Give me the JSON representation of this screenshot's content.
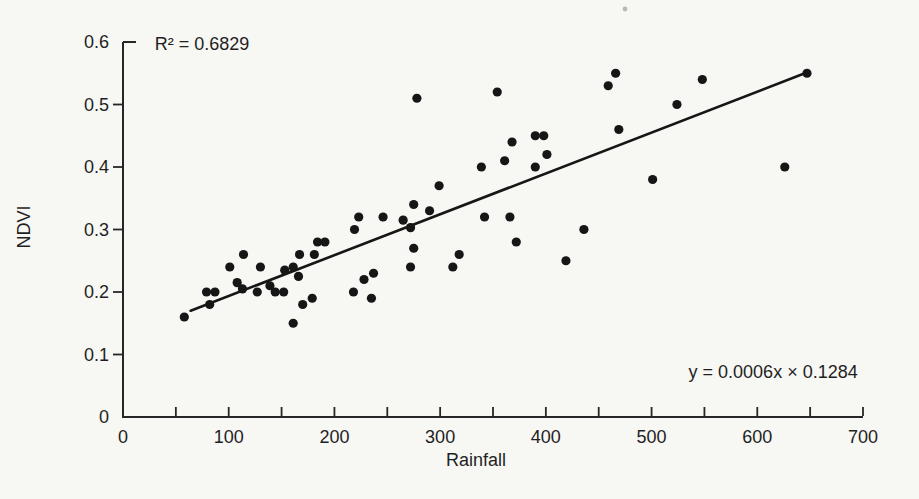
{
  "chart_data": {
    "type": "scatter",
    "title": "",
    "xlabel": "Rainfall",
    "ylabel": "NDVI",
    "xlim": [
      0,
      700
    ],
    "ylim": [
      0,
      0.6
    ],
    "grid": false,
    "legend": "none",
    "x_tick_labels": [
      "0",
      "100",
      "200",
      "300",
      "400",
      "500",
      "600",
      "700"
    ],
    "x_tick_values": [
      0,
      100,
      200,
      300,
      400,
      500,
      600,
      700
    ],
    "x_tick_step_minor": 50,
    "y_tick_labels": [
      "0",
      "0.1",
      "0.2",
      "0.3",
      "0.4",
      "0.5",
      "0.6"
    ],
    "y_tick_values": [
      0,
      0.1,
      0.2,
      0.3,
      0.4,
      0.5,
      0.6
    ],
    "annotations": [
      {
        "id": "r-squared",
        "text": "R² = 0.6829",
        "x": 30,
        "y": 0.588,
        "anchor": "start"
      },
      {
        "id": "equation",
        "text": "y = 0.0006x × 0.1284",
        "x": 695,
        "y": 0.062,
        "anchor": "end"
      }
    ],
    "trendline": {
      "x1": 64,
      "y1": 0.17,
      "x2": 648,
      "y2": 0.552
    },
    "points": [
      [
        58,
        0.16
      ],
      [
        79,
        0.2
      ],
      [
        82,
        0.18
      ],
      [
        87,
        0.2
      ],
      [
        101,
        0.24
      ],
      [
        108,
        0.215
      ],
      [
        113,
        0.205
      ],
      [
        114,
        0.26
      ],
      [
        127,
        0.2
      ],
      [
        130,
        0.24
      ],
      [
        139,
        0.21
      ],
      [
        144,
        0.2
      ],
      [
        152,
        0.2
      ],
      [
        153,
        0.235
      ],
      [
        161,
        0.15
      ],
      [
        161,
        0.24
      ],
      [
        166,
        0.225
      ],
      [
        167,
        0.26
      ],
      [
        170,
        0.18
      ],
      [
        179,
        0.19
      ],
      [
        181,
        0.26
      ],
      [
        184,
        0.28
      ],
      [
        191,
        0.28
      ],
      [
        218,
        0.2
      ],
      [
        219,
        0.3
      ],
      [
        223,
        0.32
      ],
      [
        228,
        0.22
      ],
      [
        235,
        0.19
      ],
      [
        237,
        0.23
      ],
      [
        246,
        0.32
      ],
      [
        265,
        0.315
      ],
      [
        272,
        0.24
      ],
      [
        272,
        0.303
      ],
      [
        275,
        0.27
      ],
      [
        275,
        0.34
      ],
      [
        278,
        0.51
      ],
      [
        290,
        0.33
      ],
      [
        299,
        0.37
      ],
      [
        312,
        0.24
      ],
      [
        318,
        0.26
      ],
      [
        339,
        0.4
      ],
      [
        342,
        0.32
      ],
      [
        354,
        0.52
      ],
      [
        361,
        0.41
      ],
      [
        366,
        0.32
      ],
      [
        368,
        0.44
      ],
      [
        372,
        0.28
      ],
      [
        390,
        0.4
      ],
      [
        390,
        0.45
      ],
      [
        398,
        0.45
      ],
      [
        401,
        0.42
      ],
      [
        419,
        0.25
      ],
      [
        436,
        0.3
      ],
      [
        459,
        0.53
      ],
      [
        466,
        0.55
      ],
      [
        469,
        0.46
      ],
      [
        501,
        0.38
      ],
      [
        524,
        0.5
      ],
      [
        548,
        0.54
      ],
      [
        626,
        0.4
      ],
      [
        647,
        0.55
      ]
    ]
  },
  "scan": {
    "specks_px": [
      [
        625,
        9
      ]
    ]
  },
  "colors": {
    "paper": "#f7f7f4",
    "ink": "#1f1f1f",
    "dot": "#161616",
    "axis": "#262626",
    "speck": "#b9b9b4"
  }
}
